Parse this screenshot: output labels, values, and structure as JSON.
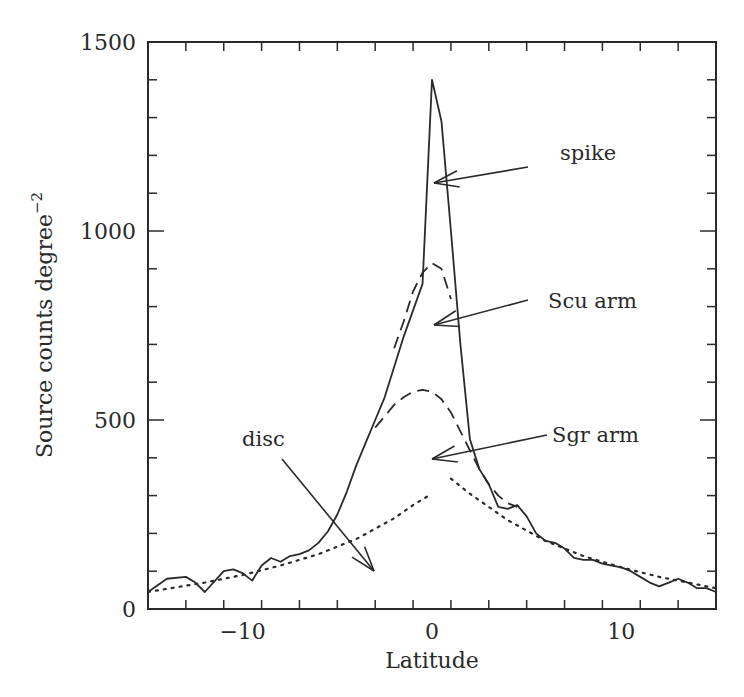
{
  "chart_data": {
    "type": "line",
    "title": "",
    "xlabel": "Latitude",
    "ylabel": "Source counts degree",
    "ylabel_superscript": "−2",
    "xlim": [
      -15,
      15
    ],
    "ylim": [
      0,
      1500
    ],
    "xticks_major": [
      -10,
      0,
      10
    ],
    "xtick_labels": [
      "−10",
      "0",
      "10"
    ],
    "xticks_minor_step": 2,
    "yticks_major": [
      0,
      500,
      1000,
      1500
    ],
    "ytick_labels": [
      "0",
      "500",
      "1000",
      "1500"
    ],
    "yticks_minor_step": 100,
    "grid": false,
    "legend": "none (curves labelled by arrow annotations)",
    "series": [
      {
        "name": "observed source counts",
        "style": "solid",
        "x": [
          -15,
          -14,
          -13,
          -12.5,
          -12,
          -11,
          -10.5,
          -10,
          -9.5,
          -9,
          -8.5,
          -8,
          -7.5,
          -7,
          -6.5,
          -6,
          -5.5,
          -5,
          -4.5,
          -4,
          -3.5,
          -3,
          -2.5,
          -2,
          -1.5,
          -1,
          -0.5,
          0,
          0.5,
          1,
          1.5,
          2,
          2.5,
          3,
          3.5,
          4,
          4.5,
          5,
          5.5,
          6,
          6.5,
          7,
          7.5,
          8,
          8.5,
          9,
          9.5,
          10,
          10.5,
          11,
          11.5,
          12,
          12.5,
          13,
          13.5,
          14,
          14.5,
          15
        ],
        "y": [
          45,
          80,
          85,
          70,
          45,
          100,
          105,
          95,
          75,
          115,
          135,
          125,
          140,
          145,
          155,
          175,
          205,
          250,
          310,
          380,
          440,
          500,
          560,
          640,
          720,
          790,
          860,
          1400,
          1290,
          1000,
          700,
          450,
          370,
          330,
          270,
          265,
          275,
          245,
          200,
          180,
          175,
          160,
          135,
          130,
          130,
          120,
          115,
          110,
          100,
          85,
          70,
          60,
          70,
          80,
          70,
          55,
          55,
          45
        ]
      },
      {
        "name": "Scu arm model",
        "style": "dashed",
        "x": [
          -2,
          -1.5,
          -1,
          -0.5,
          0,
          0.5,
          1
        ],
        "y": [
          690,
          760,
          840,
          890,
          915,
          900,
          820
        ]
      },
      {
        "name": "Sgr arm model",
        "style": "dashed",
        "x": [
          -3,
          -2.5,
          -2,
          -1.5,
          -1,
          -0.5,
          0,
          0.5,
          1,
          1.5,
          2,
          2.5,
          3,
          3.5,
          4,
          4.5
        ],
        "y": [
          480,
          510,
          540,
          560,
          575,
          580,
          575,
          555,
          520,
          470,
          420,
          370,
          330,
          300,
          280,
          270
        ]
      },
      {
        "name": "disc model",
        "style": "dotted",
        "x": [
          -15,
          -12,
          -10,
          -8,
          -6,
          -4,
          -2,
          -1,
          0,
          1,
          2,
          4,
          6,
          8,
          10,
          12,
          15
        ],
        "y": [
          45,
          70,
          90,
          115,
          145,
          185,
          240,
          275,
          305,
          345,
          305,
          235,
          180,
          140,
          110,
          85,
          55
        ]
      }
    ],
    "annotations": [
      {
        "text": "spike",
        "label_xy": [
          560,
          160
        ],
        "arrow_from": [
          528,
          167
        ],
        "arrow_to": [
          434,
          183
        ]
      },
      {
        "text": "Scu arm",
        "label_xy": [
          548,
          308
        ],
        "arrow_from": [
          528,
          300
        ],
        "arrow_to": [
          434,
          325
        ]
      },
      {
        "text": "Sgr arm",
        "label_xy": [
          552,
          442
        ],
        "arrow_from": [
          547,
          435
        ],
        "arrow_to": [
          432,
          459
        ]
      },
      {
        "text": "disc",
        "label_xy": [
          242,
          446
        ],
        "arrow_from": [
          282,
          459
        ],
        "arrow_to": [
          374,
          571
        ]
      }
    ]
  },
  "colors": {
    "background": "#ffffff",
    "ink": "#2a2a2a"
  }
}
